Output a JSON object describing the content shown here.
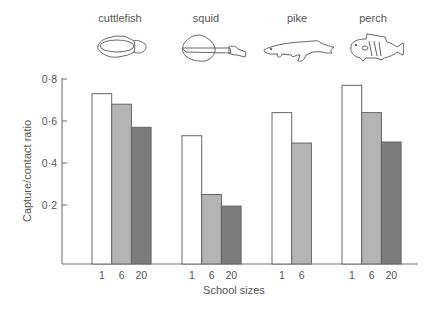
{
  "chart_data": {
    "type": "bar",
    "title": "",
    "xlabel": "School sizes",
    "ylabel": "Capture/contact ratio",
    "ylim": [
      0,
      0.8
    ],
    "yticks": [
      "0·2",
      "0·4",
      "0·6",
      "0·8"
    ],
    "ytick_values": [
      0.2,
      0.4,
      0.6,
      0.8
    ],
    "grid": false,
    "legend": null,
    "groups": [
      {
        "name": "cuttlefish",
        "sizes": [
          "1",
          "6",
          "20"
        ],
        "values": [
          0.73,
          0.68,
          0.57
        ]
      },
      {
        "name": "squid",
        "sizes": [
          "1",
          "6",
          "20"
        ],
        "values": [
          0.53,
          0.25,
          0.195
        ]
      },
      {
        "name": "pike",
        "sizes": [
          "1",
          "6"
        ],
        "values": [
          0.64,
          0.495
        ]
      },
      {
        "name": "perch",
        "sizes": [
          "1",
          "6",
          "20"
        ],
        "values": [
          0.77,
          0.64,
          0.5
        ]
      }
    ],
    "series": [
      {
        "name": "1",
        "color": "#ffffff",
        "values": [
          0.73,
          0.53,
          0.64,
          0.77
        ]
      },
      {
        "name": "6",
        "color": "#b4b4b4",
        "values": [
          0.68,
          0.25,
          0.495,
          0.64
        ]
      },
      {
        "name": "20",
        "color": "#7c7c7c",
        "values": [
          0.57,
          0.195,
          null,
          0.5
        ]
      }
    ],
    "categories": [
      "cuttlefish",
      "squid",
      "pike",
      "perch"
    ]
  },
  "colors": {
    "size_1": "#ffffff",
    "size_6": "#b4b4b4",
    "size_20": "#7c7c7c",
    "stroke": "#666666",
    "text": "#555555"
  }
}
